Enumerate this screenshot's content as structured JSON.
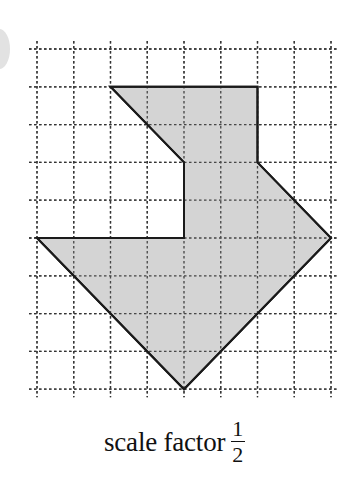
{
  "caption": {
    "text": "scale factor",
    "fraction": {
      "numerator": "1",
      "denominator": "2"
    }
  },
  "grid": {
    "columns": 9,
    "rows": 10,
    "origin_px": [
      37,
      49
    ],
    "col_spacing_px": 36.75,
    "row_spacing_px": 37.8,
    "line_style": "dotted",
    "line_color": "#333333"
  },
  "shape": {
    "fill": "#d0d0d0",
    "stroke": "#1a1a1a",
    "vertices_grid": [
      [
        2,
        1
      ],
      [
        6,
        1
      ],
      [
        6,
        3
      ],
      [
        8,
        5
      ],
      [
        4,
        9
      ],
      [
        0,
        5
      ],
      [
        4,
        5
      ],
      [
        4,
        3
      ]
    ]
  },
  "decoration": {
    "side_circle_color": "#e2e2e2"
  }
}
